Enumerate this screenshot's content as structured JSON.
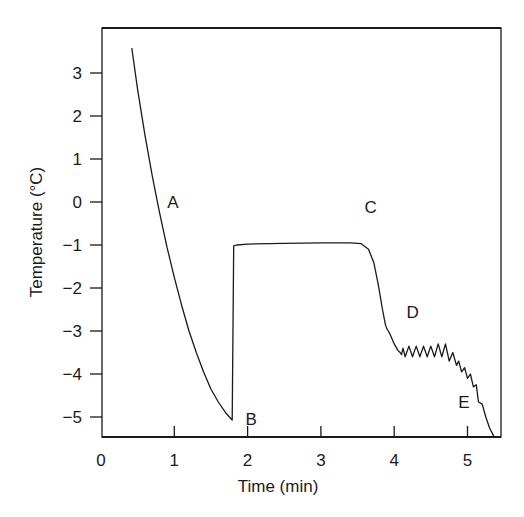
{
  "chart_data": {
    "type": "line",
    "title": "",
    "xlabel": "Time (min)",
    "ylabel": "Temperature (°C)",
    "xlim": [
      0,
      5.45
    ],
    "ylim": [
      -5.45,
      4.05
    ],
    "grid": false,
    "legend": null,
    "xticks": [
      0,
      1,
      2,
      3,
      4,
      5
    ],
    "xtick_labels": [
      "0",
      "1",
      "2",
      "3",
      "4",
      "5"
    ],
    "yticks": [
      3,
      2,
      1,
      0,
      -1,
      -2,
      -3,
      -4,
      -5
    ],
    "ytick_labels": [
      "3",
      "2",
      "1",
      "0",
      "−1",
      "−2",
      "−3",
      "−4",
      "−5"
    ],
    "series": [
      {
        "name": "temperature",
        "color": "#1a1a1a",
        "x": [
          0.42,
          0.5,
          0.6,
          0.7,
          0.8,
          0.9,
          1.0,
          1.1,
          1.2,
          1.3,
          1.4,
          1.5,
          1.6,
          1.7,
          1.79,
          1.81,
          1.85,
          2.0,
          2.5,
          3.0,
          3.4,
          3.55,
          3.65,
          3.72,
          3.78,
          3.84,
          3.88,
          3.9,
          3.92,
          3.95,
          4.0,
          4.05,
          4.08,
          4.1,
          4.12,
          4.15,
          4.2,
          4.25,
          4.3,
          4.35,
          4.4,
          4.45,
          4.5,
          4.55,
          4.6,
          4.65,
          4.7,
          4.75,
          4.8,
          4.85,
          4.88,
          4.92,
          4.96,
          5.0,
          5.04,
          5.08,
          5.12,
          5.15,
          5.2,
          5.25,
          5.3,
          5.36
        ],
        "y": [
          3.58,
          2.6,
          1.55,
          0.6,
          -0.25,
          -1.05,
          -1.75,
          -2.4,
          -3.0,
          -3.5,
          -3.95,
          -4.35,
          -4.65,
          -4.9,
          -5.07,
          -1.02,
          -1.0,
          -0.98,
          -0.96,
          -0.95,
          -0.95,
          -0.97,
          -1.1,
          -1.4,
          -1.9,
          -2.5,
          -2.85,
          -2.95,
          -3.0,
          -3.1,
          -3.3,
          -3.45,
          -3.5,
          -3.55,
          -3.4,
          -3.6,
          -3.35,
          -3.6,
          -3.35,
          -3.6,
          -3.35,
          -3.6,
          -3.35,
          -3.6,
          -3.3,
          -3.6,
          -3.3,
          -3.7,
          -3.5,
          -3.8,
          -3.7,
          -3.95,
          -3.85,
          -4.1,
          -4.0,
          -4.3,
          -4.25,
          -4.65,
          -4.7,
          -5.0,
          -5.25,
          -5.45
        ]
      }
    ],
    "annotations": [
      {
        "text": "A",
        "x": 0.98,
        "y": 0.0
      },
      {
        "text": "B",
        "x": 2.05,
        "y": -5.05
      },
      {
        "text": "C",
        "x": 3.68,
        "y": -0.12
      },
      {
        "text": "D",
        "x": 4.25,
        "y": -2.55
      },
      {
        "text": "E",
        "x": 4.95,
        "y": -4.65
      }
    ]
  }
}
